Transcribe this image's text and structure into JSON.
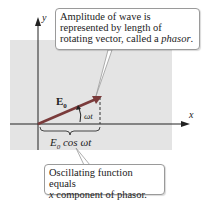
{
  "diagram": {
    "axes": {
      "x_label": "x",
      "y_label": "y"
    },
    "phasor": {
      "label_main": "E",
      "label_sub": "0",
      "angle_label": "ωt",
      "color": "#7a3b3b"
    },
    "projection": {
      "label_main": "E",
      "label_sub": "0",
      "label_rest": " cos ωt"
    },
    "callout_top": {
      "line1": "Amplitude of wave is",
      "line2": "represented by length of",
      "line3_plain": "rotating vector, called a ",
      "line3_italic": "phasor",
      "line3_end": "."
    },
    "callout_bottom": {
      "line1": "Oscillating function equals",
      "line2_italic": "x",
      "line2_rest": " component of phasor."
    },
    "colors": {
      "panel": "#e4e4e4",
      "axis": "#222222",
      "callout_border": "#9a9a9a"
    }
  }
}
